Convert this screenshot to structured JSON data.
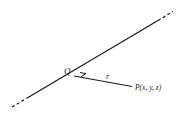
{
  "diagram": {
    "labels": {
      "foot_point": "Q",
      "distance": "r",
      "point": "P(x, y, z)"
    },
    "colors": {
      "stroke": "#1a1a1a",
      "background": "#ffffff"
    },
    "elements": {
      "line": "infinite line (dashed ends indicate extension)",
      "perpendicular": "segment from Q to P, perpendicular to line",
      "right_angle_marker": "small square at Q"
    }
  }
}
